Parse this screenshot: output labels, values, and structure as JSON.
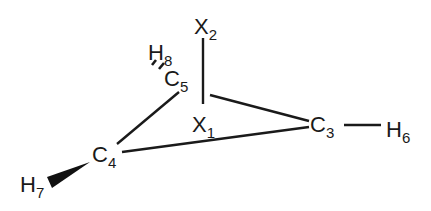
{
  "diagram": {
    "type": "molecular-structure",
    "atoms": [
      {
        "id": "X2",
        "symbol": "X",
        "index": "2",
        "x": 194,
        "y": 34
      },
      {
        "id": "H8",
        "symbol": "H",
        "index": "8",
        "x": 148,
        "y": 60
      },
      {
        "id": "C5",
        "symbol": "C",
        "index": "5",
        "x": 164,
        "y": 86
      },
      {
        "id": "X1",
        "symbol": "X",
        "index": "1",
        "x": 192,
        "y": 132
      },
      {
        "id": "C3",
        "symbol": "C",
        "index": "3",
        "x": 310,
        "y": 132
      },
      {
        "id": "H6",
        "symbol": "H",
        "index": "6",
        "x": 386,
        "y": 137
      },
      {
        "id": "C4",
        "symbol": "C",
        "index": "4",
        "x": 92,
        "y": 162
      },
      {
        "id": "H7",
        "symbol": "H",
        "index": "7",
        "x": 20,
        "y": 192
      }
    ],
    "bonds": [
      {
        "from": "X2",
        "to": "X1",
        "style": "single",
        "x1": 203,
        "y1": 38,
        "x2": 203,
        "y2": 104
      },
      {
        "from": "C5",
        "to": "C4",
        "style": "single",
        "x1": 179,
        "y1": 92,
        "x2": 117,
        "y2": 144
      },
      {
        "from": "X1-X2-axis",
        "to": "C3",
        "style": "single",
        "x1": 210,
        "y1": 95,
        "x2": 309,
        "y2": 121
      },
      {
        "from": "C4",
        "to": "C3",
        "style": "single",
        "x1": 122,
        "y1": 152,
        "x2": 309,
        "y2": 127
      },
      {
        "from": "C3",
        "to": "H6",
        "style": "single",
        "x1": 344,
        "y1": 125,
        "x2": 381,
        "y2": 125
      },
      {
        "from": "C5",
        "to": "H8",
        "style": "hashed"
      },
      {
        "from": "C4",
        "to": "H7",
        "style": "wedge"
      }
    ]
  }
}
